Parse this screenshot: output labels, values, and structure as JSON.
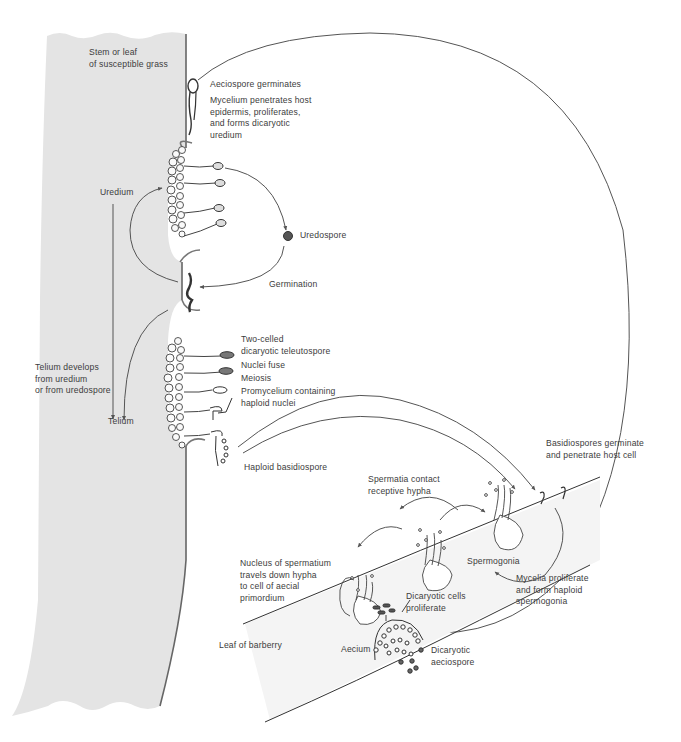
{
  "diagram": {
    "colors": {
      "grass_fill": "#e4e4e4",
      "barberry_fill": "#f3f3f3",
      "line": "#555555",
      "text": "#3c3c3c",
      "background": "#ffffff"
    },
    "labels": {
      "grass": "Stem or leaf\nof susceptible grass",
      "aeciospore_germinates": "Aeciospore germinates",
      "mycelium_penetrates": "Mycelium penetrates host\nepidermis, proliferates,\nand forms dicaryotic\nuredium",
      "uredium": "Uredium",
      "uredospore": "Uredospore",
      "germination": "Germination",
      "telium_develops": "Telium develops\nfrom uredium\nor from uredospore",
      "telium": "Telium",
      "two_celled": "Two-celled\ndicaryotic teleutospore",
      "nuclei_fuse": "Nuclei fuse",
      "meiosis": "Meiosis",
      "promycelium": "Promycelium containing\nhaploid nuclei",
      "haploid_basidiospore": "Haploid basidiospore",
      "basidiospores_germinate": "Basidiospores germinate\nand penetrate host cell",
      "spermatia_contact": "Spermatia contact\nreceptive hypha",
      "spermogonia": "Spermogonia",
      "mycelia_proliferate": "Mycelia proliferate\nand form haploid\nspermogonia",
      "nucleus_spermatium": "Nucleus of spermatium\ntravels down hypha\nto cell of aecial\nprimordium",
      "dicaryotic_cells": "Dicaryotic cells\nproliferate",
      "leaf_barberry": "Leaf of barberry",
      "aecium": "Aecium",
      "dicaryotic_aeciospore": "Dicaryotic\naeciospore"
    }
  }
}
